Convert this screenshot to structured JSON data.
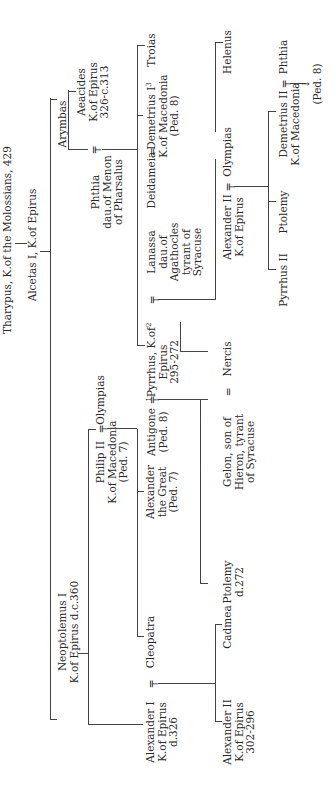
{
  "people": {
    "tharypus": "Tharypus, K.of the Molossians, 429",
    "alcetas": "Alcetas I, K.of Epirus",
    "neoptolemus": [
      "Neoptolemus I",
      "K.of Epirus d.c.360"
    ],
    "arymbas": "Arymbas",
    "aeacides": [
      "Aeacides",
      "K.of Epirus",
      "326-c.313"
    ],
    "phthia1": [
      "Phthia",
      "dau.of Menon",
      "of Pharsalus"
    ],
    "troias": "Troias",
    "deidameia": "Deidameia",
    "demetrius1": [
      "Demetrius I",
      "K.of Macedonia",
      "(Ped. 8)"
    ],
    "demetrius1_sup": "3",
    "pyrrhus": [
      "Pyrrhus, K.of",
      "Epirus",
      "295-272"
    ],
    "pyrrhus_sup_pre": "1",
    "pyrrhus_sup_post": "2",
    "lanassa": [
      "Lanassa",
      "dau.of",
      "Agathocles",
      "tyrant of",
      "Syracuse"
    ],
    "antigone": [
      "Antigone",
      "(Ped. 8)"
    ],
    "nercis": "Nercis",
    "gelon": [
      "Gelon, son of",
      "Hieron, tyrant",
      "of Syracuse"
    ],
    "ptolemy_d272": [
      "Ptolemy",
      "d.272"
    ],
    "alexander2_epirus": [
      "Alexander II",
      "K.of Epirus"
    ],
    "olympias_2": "Olympias",
    "helenus": "Helenus",
    "pyrrhus2": "Pyrrhus II",
    "ptolemy_2": "Ptolemy",
    "demetrius2": [
      "Demetrius II",
      "K.of Macedonia"
    ],
    "phthia2": "Phthia",
    "ped8_arrow": "(Ped. 8)",
    "philip2": [
      "Philip II",
      "K.of Macedonia",
      "(Ped. 7)"
    ],
    "olympias_1": "Olympias",
    "alexander_great": [
      "Alexander",
      "the Great",
      "(Ped. 7)"
    ],
    "cleopatra": "Cleopatra",
    "alexander1": [
      "Alexander I",
      "K.of Epirus",
      "d.326"
    ],
    "cadmea": "Cadmea",
    "alexander2_302": [
      "Alexander II",
      "K.of Epirus",
      "302-296"
    ]
  },
  "symbols": {
    "marriage": "=",
    "marriage_descent": "╤",
    "arrow": "→"
  }
}
